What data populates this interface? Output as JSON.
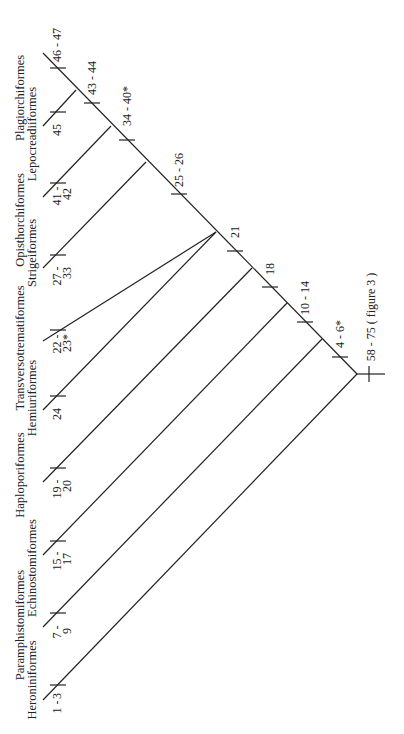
{
  "diagram": {
    "type": "cladogram",
    "orientation": "rotated-90-ccw",
    "taxa": [
      {
        "name": "Heroniniformes",
        "row": 1,
        "characters": "1 - 3"
      },
      {
        "name": "Paramphistomiformes",
        "row": 0,
        "characters": "7 - 9"
      },
      {
        "name": "Echinostomiformes",
        "row": 1,
        "characters": "15 - 17"
      },
      {
        "name": "Haploporiformes",
        "row": 0,
        "characters": "19 - 20"
      },
      {
        "name": "Hemiuriformes",
        "row": 1,
        "characters": "24"
      },
      {
        "name": "Transversotrematiformes",
        "row": 0,
        "characters": "22 - 23*"
      },
      {
        "name": "Strigeiformes",
        "row": 1,
        "characters": "27 - 33"
      },
      {
        "name": "Opisthorchiformes",
        "row": 0,
        "characters": "41 - 42"
      },
      {
        "name": "Lepocreadiiformes",
        "row": 1,
        "characters": "45"
      },
      {
        "name": "Plagiorchiformes",
        "row": 0,
        "characters": "46 - 47"
      }
    ],
    "leaf_labels": {
      "heroni_a": "1 -",
      "heroni_b": "3",
      "paramph_a": "7 -",
      "paramph_b": "9",
      "echino_a": "15 -",
      "echino_b": "17",
      "haplo_a": "19 -",
      "haplo_b": "20",
      "hemiur": "24",
      "transv_a": "22 -",
      "transv_b": "23*",
      "strige_a": "27 -",
      "strige_b": "33",
      "opist_a": "41 -",
      "opist_b": "42",
      "lepo": "45",
      "plagio": "46 - 47"
    },
    "node_labels": {
      "root": "58 - 75 ( figure 3 )",
      "n1": "4 - 6*",
      "n2": "10 - 14",
      "n3": "18",
      "n4": "21",
      "n5": "25 - 26",
      "n6": "34 - 40*",
      "n7": "43 - 44"
    },
    "taxon_names": {
      "plagio": "Plagiorchiformes",
      "lepo": "Lepocreadiiformes",
      "opist": "Opisthorchiformes",
      "strige": "Strigeiformes",
      "transv": "Transversotrematiformes",
      "hemiur": "Hemiuriformes",
      "haplo": "Haploporiformes",
      "echino": "Echinostomiformes",
      "paramph": "Paramphistomiformes",
      "heroni": "Heroniniformes"
    }
  }
}
